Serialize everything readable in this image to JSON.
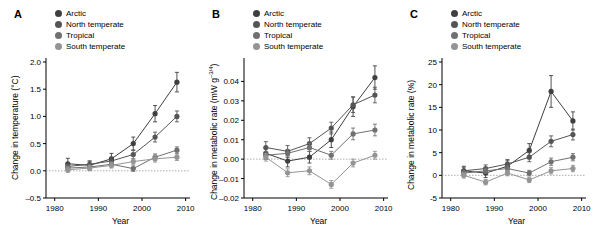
{
  "figure": {
    "panels": [
      {
        "letter": "A",
        "ylabel": "Change in temperature (°C)",
        "xlabel": "Year"
      },
      {
        "letter": "B",
        "ylabel": "Change in metabolic rate (mW g",
        "ylabel_sup": "–3/4",
        "ylabel_tail": ")",
        "xlabel": "Year"
      },
      {
        "letter": "C",
        "ylabel": "Change in metabolic rate (%)",
        "xlabel": "Year"
      }
    ],
    "legend": [
      {
        "label": "Arctic",
        "color": "#3f3f3f"
      },
      {
        "label": "North temperate",
        "color": "#555555"
      },
      {
        "label": "Tropical",
        "color": "#707070"
      },
      {
        "label": "South temperate",
        "color": "#949494"
      }
    ]
  },
  "chart_data": [
    {
      "type": "line",
      "title": "A",
      "xlabel": "Year",
      "ylabel": "Change in temperature (°C)",
      "xlim": [
        1978,
        2011
      ],
      "ylim": [
        -0.5,
        2.0
      ],
      "xticks": [
        1980,
        1990,
        2000,
        2010
      ],
      "yticks": [
        -0.5,
        0,
        0.5,
        1.0,
        1.5,
        2.0
      ],
      "grid": false,
      "zero_line": true,
      "legend_position": "top-left",
      "series": [
        {
          "name": "Arctic",
          "color": "#3f3f3f",
          "x": [
            1983,
            1988,
            1993,
            1998,
            2003,
            2008
          ],
          "y": [
            0.13,
            0.1,
            0.22,
            0.5,
            1.05,
            1.63
          ],
          "yerr": [
            0.1,
            0.08,
            0.1,
            0.12,
            0.15,
            0.18
          ]
        },
        {
          "name": "North temperate",
          "color": "#555555",
          "x": [
            1983,
            1988,
            1993,
            1998,
            2003,
            2008
          ],
          "y": [
            0.08,
            0.12,
            0.18,
            0.3,
            0.62,
            1.0
          ],
          "yerr": [
            0.06,
            0.06,
            0.07,
            0.08,
            0.09,
            0.1
          ]
        },
        {
          "name": "Tropical",
          "color": "#707070",
          "x": [
            1983,
            1988,
            1993,
            1998,
            2003,
            2008
          ],
          "y": [
            0.05,
            0.07,
            0.12,
            0.04,
            0.25,
            0.38
          ],
          "yerr": [
            0.05,
            0.05,
            0.05,
            0.05,
            0.06,
            0.06
          ]
        },
        {
          "name": "South temperate",
          "color": "#949494",
          "x": [
            1983,
            1988,
            1993,
            1998,
            2003,
            2008
          ],
          "y": [
            0.02,
            0.05,
            0.1,
            0.17,
            0.22,
            0.25
          ],
          "yerr": [
            0.05,
            0.05,
            0.05,
            0.05,
            0.06,
            0.06
          ]
        }
      ]
    },
    {
      "type": "line",
      "title": "B",
      "xlabel": "Year",
      "ylabel": "Change in metabolic rate (mW g–3/4)",
      "xlim": [
        1978,
        2011
      ],
      "ylim": [
        -0.02,
        0.05
      ],
      "xticks": [
        1980,
        1990,
        2000,
        2010
      ],
      "yticks": [
        -0.02,
        -0.01,
        0,
        0.01,
        0.02,
        0.03,
        0.04
      ],
      "grid": false,
      "zero_line": true,
      "legend_position": "top-left",
      "series": [
        {
          "name": "Arctic",
          "color": "#3f3f3f",
          "x": [
            1983,
            1988,
            1993,
            1998,
            2003,
            2008
          ],
          "y": [
            0.003,
            -0.001,
            0.001,
            0.01,
            0.027,
            0.042
          ],
          "yerr": [
            0.003,
            0.003,
            0.003,
            0.004,
            0.005,
            0.006
          ]
        },
        {
          "name": "North temperate",
          "color": "#555555",
          "x": [
            1983,
            1988,
            1993,
            1998,
            2003,
            2008
          ],
          "y": [
            0.006,
            0.004,
            0.008,
            0.016,
            0.028,
            0.033
          ],
          "yerr": [
            0.003,
            0.003,
            0.003,
            0.003,
            0.004,
            0.004
          ]
        },
        {
          "name": "Tropical",
          "color": "#707070",
          "x": [
            1983,
            1988,
            1993,
            1998,
            2003,
            2008
          ],
          "y": [
            0.002,
            0.003,
            0.006,
            0.002,
            0.013,
            0.015
          ],
          "yerr": [
            0.002,
            0.002,
            0.002,
            0.002,
            0.003,
            0.003
          ]
        },
        {
          "name": "South temperate",
          "color": "#949494",
          "x": [
            1983,
            1988,
            1993,
            1998,
            2003,
            2008
          ],
          "y": [
            0.001,
            -0.007,
            -0.006,
            -0.013,
            -0.002,
            0.002
          ],
          "yerr": [
            0.002,
            0.002,
            0.002,
            0.002,
            0.002,
            0.002
          ]
        }
      ]
    },
    {
      "type": "line",
      "title": "C",
      "xlabel": "Year",
      "ylabel": "Change in metabolic rate (%)",
      "xlim": [
        1978,
        2011
      ],
      "ylim": [
        -5,
        25
      ],
      "xticks": [
        1980,
        1990,
        2000,
        2010
      ],
      "yticks": [
        -5,
        0,
        5,
        10,
        15,
        20,
        25
      ],
      "grid": false,
      "zero_line": true,
      "legend_position": "top-left",
      "series": [
        {
          "name": "Arctic",
          "color": "#3f3f3f",
          "x": [
            1983,
            1988,
            1993,
            1998,
            2003,
            2008
          ],
          "y": [
            1.0,
            0.5,
            2.0,
            5.5,
            18.5,
            12.0
          ],
          "yerr": [
            1.0,
            1.0,
            1.2,
            1.5,
            3.5,
            2.0
          ]
        },
        {
          "name": "North temperate",
          "color": "#555555",
          "x": [
            1983,
            1988,
            1993,
            1998,
            2003,
            2008
          ],
          "y": [
            1.0,
            1.5,
            2.5,
            4.0,
            7.5,
            9.0
          ],
          "yerr": [
            0.8,
            0.8,
            1.0,
            1.0,
            1.2,
            1.2
          ]
        },
        {
          "name": "Tropical",
          "color": "#707070",
          "x": [
            1983,
            1988,
            1993,
            1998,
            2003,
            2008
          ],
          "y": [
            0.5,
            1.0,
            1.5,
            0.5,
            3.0,
            4.0
          ],
          "yerr": [
            0.6,
            0.6,
            0.6,
            0.6,
            0.8,
            0.8
          ]
        },
        {
          "name": "South temperate",
          "color": "#949494",
          "x": [
            1983,
            1988,
            1993,
            1998,
            2003,
            2008
          ],
          "y": [
            0.0,
            -1.5,
            0.5,
            -1.0,
            1.0,
            1.5
          ],
          "yerr": [
            0.6,
            0.6,
            0.6,
            0.6,
            0.7,
            0.7
          ]
        }
      ]
    }
  ]
}
